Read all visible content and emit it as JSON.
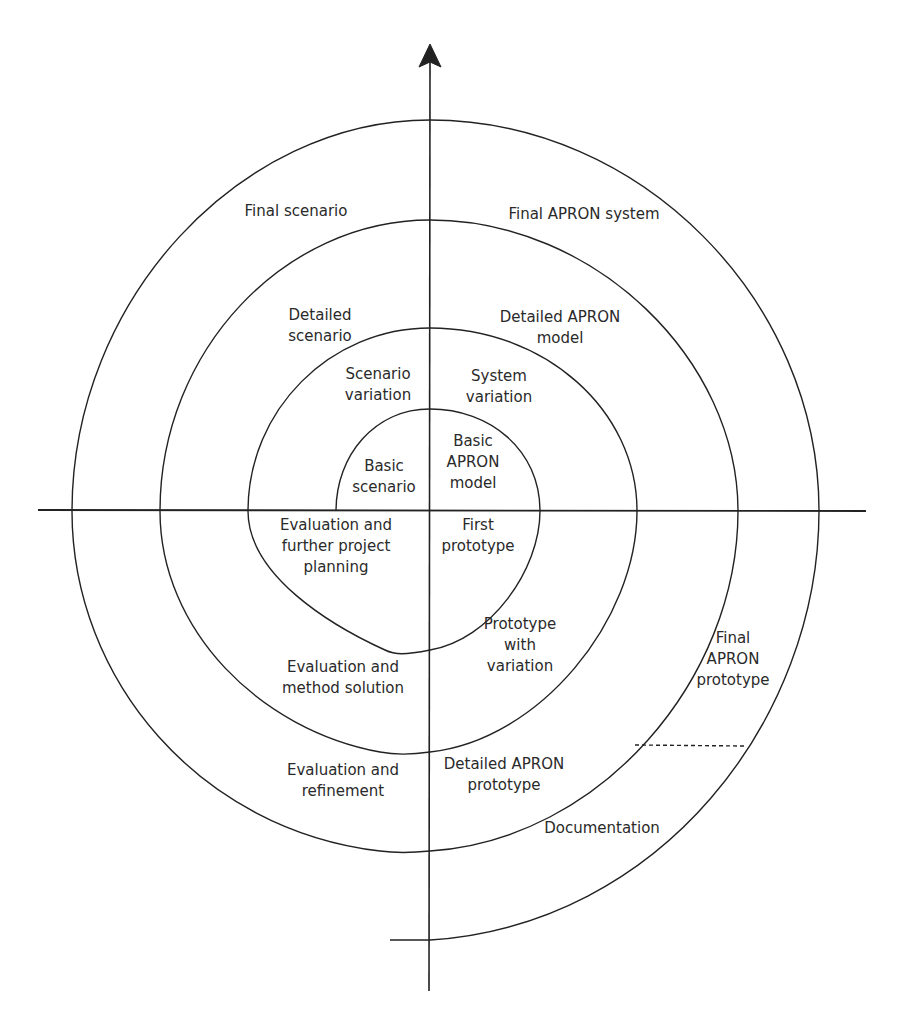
{
  "diagram": {
    "type": "spiral-model",
    "line_color": "#222222",
    "background": "#ffffff",
    "axes": {
      "vertical": {
        "arrow": "up"
      },
      "horizontal": {
        "arrow": "none"
      }
    },
    "quadrant_labels": {
      "top_left": [
        {
          "id": "basic-scenario",
          "lines": [
            "Basic",
            "scenario"
          ]
        },
        {
          "id": "scenario-variation",
          "lines": [
            "Scenario",
            "variation"
          ]
        },
        {
          "id": "detailed-scenario",
          "lines": [
            "Detailed",
            "scenario"
          ]
        },
        {
          "id": "final-scenario",
          "lines": [
            "Final scenario"
          ]
        }
      ],
      "top_right": [
        {
          "id": "basic-apron-model",
          "lines": [
            "Basic",
            "APRON",
            "model"
          ]
        },
        {
          "id": "system-variation",
          "lines": [
            "System",
            "variation"
          ]
        },
        {
          "id": "detailed-apron-model",
          "lines": [
            "Detailed APRON",
            "model"
          ]
        },
        {
          "id": "final-apron-system",
          "lines": [
            "Final APRON system"
          ]
        }
      ],
      "bottom_right": [
        {
          "id": "first-prototype",
          "lines": [
            "First",
            "prototype"
          ]
        },
        {
          "id": "prototype-with-variation",
          "lines": [
            "Prototype",
            "with",
            "variation"
          ]
        },
        {
          "id": "detailed-apron-prototype",
          "lines": [
            "Detailed APRON",
            "prototype"
          ]
        },
        {
          "id": "final-apron-prototype",
          "lines": [
            "Final",
            "APRON",
            "prototype"
          ]
        },
        {
          "id": "documentation",
          "lines": [
            "Documentation"
          ]
        }
      ],
      "bottom_left": [
        {
          "id": "evaluation-further-planning",
          "lines": [
            "Evaluation and",
            "further project",
            "planning"
          ]
        },
        {
          "id": "evaluation-method-solution",
          "lines": [
            "Evaluation and",
            "method solution"
          ]
        },
        {
          "id": "evaluation-refinement",
          "lines": [
            "Evaluation and",
            "refinement"
          ]
        }
      ]
    }
  }
}
